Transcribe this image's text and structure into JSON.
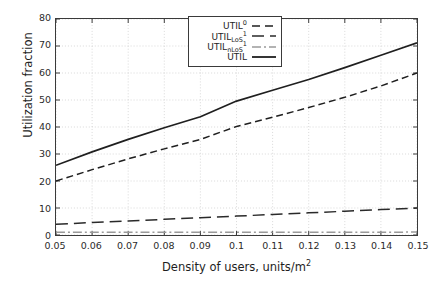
{
  "chart_data": {
    "type": "line",
    "title": "",
    "xlabel": "Density of users, units/m",
    "xlabel_sup": "2",
    "ylabel": "Utilization fraction",
    "xlim": [
      0.05,
      0.15
    ],
    "ylim": [
      0,
      80
    ],
    "grid": true,
    "legend_position": "top-center",
    "xticks": [
      "0.05",
      "0.06",
      "0.07",
      "0.08",
      "0.09",
      "0.1",
      "0.11",
      "0.12",
      "0.13",
      "0.14",
      "0.15"
    ],
    "xtick_values": [
      0.05,
      0.06,
      0.07,
      0.08,
      0.09,
      0.1,
      0.11,
      0.12,
      0.13,
      0.14,
      0.15
    ],
    "yticks": [
      "0",
      "10",
      "20",
      "30",
      "40",
      "50",
      "60",
      "70",
      "80"
    ],
    "ytick_values": [
      0,
      10,
      20,
      30,
      40,
      50,
      60,
      70,
      80
    ],
    "x": [
      0.05,
      0.06,
      0.07,
      0.08,
      0.09,
      0.1,
      0.11,
      0.12,
      0.13,
      0.14,
      0.15
    ],
    "series": [
      {
        "name": "UTIL",
        "label_base": "UTIL",
        "label_sub": "",
        "label_sup": "",
        "style": "solid",
        "color": "#1f1f1f",
        "values": [
          25.8,
          30.8,
          35.4,
          39.7,
          43.8,
          49.6,
          53.6,
          57.6,
          62.0,
          66.6,
          71.2
        ]
      },
      {
        "name": "UTIL0",
        "label_base": "UTIL",
        "label_sub": "",
        "label_sup": "0",
        "style": "dashed",
        "color": "#1f1f1f",
        "values": [
          20.0,
          24.2,
          28.2,
          31.9,
          35.4,
          40.2,
          43.6,
          47.2,
          51.0,
          55.2,
          60.0
        ]
      },
      {
        "name": "UTIL_LoS1",
        "label_base": "UTIL",
        "label_sub": "LoS",
        "label_sup": "1",
        "style": "longdash",
        "color": "#2a2a2a",
        "values": [
          4.0,
          4.6,
          5.2,
          5.8,
          6.4,
          7.0,
          7.6,
          8.2,
          8.8,
          9.4,
          10.0
        ]
      },
      {
        "name": "UTIL_nLoS1",
        "label_base": "UTIL",
        "label_sub": "nLoS",
        "label_sup": "1",
        "style": "dashdot",
        "color": "#9a9a9a",
        "values": [
          1.0,
          1.0,
          1.0,
          1.0,
          1.0,
          1.0,
          1.0,
          1.0,
          1.0,
          1.0,
          1.1
        ]
      }
    ]
  }
}
